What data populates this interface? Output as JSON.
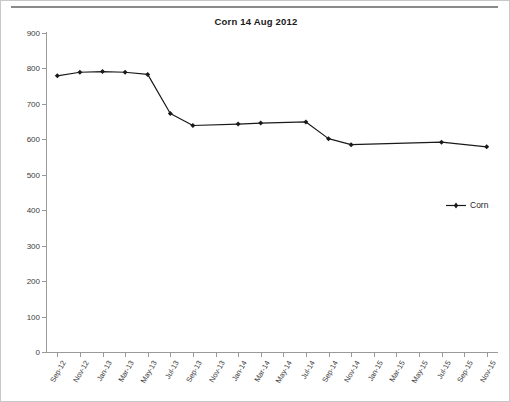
{
  "page": {
    "background_color": "#ffffff",
    "rule_color": "#8a8a8a"
  },
  "chart": {
    "title": "Corn 14 Aug 2012",
    "legend_label": "Corn",
    "series_color": "#1a1a1a",
    "axis_color": "#9a9a9a",
    "tick_text_color": "#3d3d3d"
  },
  "chart_data": {
    "type": "line",
    "title": "Corn 14 Aug 2012",
    "xlabel": "",
    "ylabel": "",
    "ylim": [
      0,
      900
    ],
    "ytick_step": 100,
    "yticks": [
      0,
      100,
      200,
      300,
      400,
      500,
      600,
      700,
      800,
      900
    ],
    "grid": false,
    "legend_position": "right",
    "marker": "diamond",
    "categories": [
      "Sep-12",
      "Nov-12",
      "Jan-13",
      "Mar-13",
      "May-13",
      "Jul-13",
      "Sep-13",
      "Nov-13",
      "Jan-14",
      "Mar-14",
      "May-14",
      "Jul-14",
      "Sep-14",
      "Nov-14",
      "Jan-15",
      "Mar-15",
      "May-15",
      "Jul-15",
      "Sep-15",
      "Nov-15"
    ],
    "series": [
      {
        "name": "Corn",
        "color": "#1a1a1a",
        "values": [
          778,
          788,
          790,
          788,
          782,
          672,
          638,
          null,
          642,
          645,
          null,
          648,
          601,
          584,
          null,
          null,
          null,
          591,
          null,
          578
        ]
      }
    ]
  }
}
